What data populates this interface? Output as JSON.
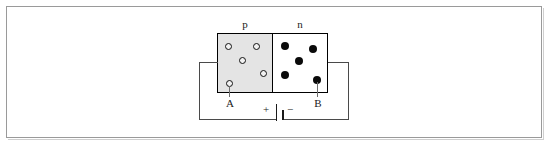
{
  "figure": {
    "title_visible": false,
    "frame": {
      "border_color": "#9a9a9a",
      "background": "#ffffff"
    }
  },
  "labels": {
    "p_region": "p",
    "n_region": "n",
    "terminal_a": "A",
    "terminal_b": "B",
    "battery_positive": "+",
    "battery_negative": "−"
  },
  "diagram_data": {
    "type": "circuit-schematic",
    "subject": "pn-junction-diode-forward-bias",
    "colors": {
      "p_region_fill": "#e4e4e4",
      "n_region_fill": "#ffffff",
      "outline": "#000000",
      "wire": "#4a4a4a",
      "hole_marker": "#f2f2f2",
      "electron_marker": "#0a0a0a"
    },
    "regions": [
      {
        "name": "p",
        "label": "p",
        "fill": "#e4e4e4",
        "box": {
          "x": 217,
          "y": 33,
          "w": 56,
          "h": 60
        },
        "carrier_type": "hole",
        "carrier_symbol": "open-circle",
        "carrier_count": 5,
        "carriers": [
          {
            "x": 228,
            "y": 46
          },
          {
            "x": 256,
            "y": 46
          },
          {
            "x": 242,
            "y": 60
          },
          {
            "x": 263,
            "y": 73
          },
          {
            "x": 229,
            "y": 83
          }
        ]
      },
      {
        "name": "n",
        "label": "n",
        "fill": "#ffffff",
        "box": {
          "x": 272,
          "y": 33,
          "w": 56,
          "h": 60
        },
        "carrier_type": "electron",
        "carrier_symbol": "filled-circle",
        "carrier_count": 5,
        "carriers": [
          {
            "x": 285,
            "y": 46
          },
          {
            "x": 313,
            "y": 49
          },
          {
            "x": 299,
            "y": 61
          },
          {
            "x": 285,
            "y": 75
          },
          {
            "x": 317,
            "y": 80
          }
        ]
      }
    ],
    "junction": {
      "x": 272,
      "y_top": 33,
      "y_bottom": 93
    },
    "terminals": [
      {
        "label": "A",
        "lead_from": {
          "x": 229,
          "y": 83
        },
        "lead_to": {
          "x": 229,
          "y": 97
        },
        "label_pos": {
          "x": 229,
          "y": 103
        }
      },
      {
        "label": "B",
        "lead_from": {
          "x": 317,
          "y": 80
        },
        "lead_to": {
          "x": 317,
          "y": 97
        },
        "label_pos": {
          "x": 317,
          "y": 103
        }
      }
    ],
    "battery": {
      "positive_plate": {
        "x": 276,
        "y_top": 104,
        "y_bottom": 121,
        "length": 17,
        "thickness": 1
      },
      "negative_plate": {
        "x": 283,
        "y_top": 110,
        "y_bottom": 120,
        "length": 10,
        "thickness": 2
      },
      "positive_sign_pos": {
        "x": 266,
        "y": 110
      },
      "negative_sign_pos": {
        "x": 290,
        "y": 110
      }
    },
    "wires": [
      {
        "from": {
          "x": 217,
          "y": 62
        },
        "to": {
          "x": 199,
          "y": 62
        },
        "orientation": "horizontal"
      },
      {
        "from": {
          "x": 199,
          "y": 62
        },
        "to": {
          "x": 199,
          "y": 119
        },
        "orientation": "vertical"
      },
      {
        "from": {
          "x": 199,
          "y": 119
        },
        "to": {
          "x": 276,
          "y": 119
        },
        "orientation": "horizontal"
      },
      {
        "from": {
          "x": 283,
          "y": 119
        },
        "to": {
          "x": 348,
          "y": 119
        },
        "orientation": "horizontal"
      },
      {
        "from": {
          "x": 348,
          "y": 119
        },
        "to": {
          "x": 348,
          "y": 62
        },
        "orientation": "vertical"
      },
      {
        "from": {
          "x": 348,
          "y": 62
        },
        "to": {
          "x": 328,
          "y": 62
        },
        "orientation": "horizontal"
      }
    ]
  }
}
